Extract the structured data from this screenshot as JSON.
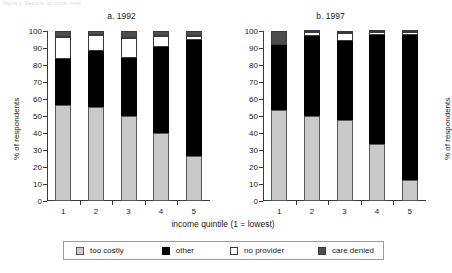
{
  "figure_tag": "Figure 1. Reasons for unmet need",
  "xaxis_title": "income quintile (1 = lowest)",
  "ylabel": "% of respondents",
  "legend": [
    {
      "label": "too costly",
      "key": "too-costly",
      "color": "#c9c9c9"
    },
    {
      "label": "other",
      "key": "other",
      "color": "#000000"
    },
    {
      "label": "no provider",
      "key": "no-provider",
      "color": "#ffffff"
    },
    {
      "label": "care denied",
      "key": "care-denied",
      "color": "#4d4d4d"
    }
  ],
  "panels": [
    {
      "id": "a",
      "title": "a. 1992"
    },
    {
      "id": "b",
      "title": "b. 1997"
    }
  ],
  "yticks": [
    "0",
    "10",
    "20",
    "30",
    "40",
    "50",
    "60",
    "70",
    "80",
    "90",
    "100"
  ],
  "xticks": [
    "1",
    "2",
    "3",
    "4",
    "5"
  ],
  "chart_data": {
    "type": "bar",
    "subtype": "stacked-100-percent",
    "xlabel": "income quintile (1 = lowest)",
    "ylabel": "% of respondents",
    "ylim": [
      0,
      100
    ],
    "ytick_step": 10,
    "grid": false,
    "legend_position": "bottom",
    "legend_entries": [
      "too costly",
      "other",
      "no provider",
      "care denied"
    ],
    "panels": [
      {
        "name": "a. 1992",
        "categories": [
          "1",
          "2",
          "3",
          "4",
          "5"
        ],
        "series": [
          {
            "name": "too costly",
            "values": [
              56.5,
              55.5,
              50.0,
              40.0,
              26.5
            ]
          },
          {
            "name": "other",
            "values": [
              27.0,
              33.0,
              34.0,
              50.5,
              68.5
            ]
          },
          {
            "name": "no provider",
            "values": [
              13.0,
              9.0,
              12.0,
              6.5,
              2.0
            ]
          },
          {
            "name": "care denied",
            "values": [
              3.5,
              2.5,
              4.0,
              3.0,
              3.0
            ]
          }
        ],
        "cumulative_tops": {
          "too costly": [
            56.5,
            55.5,
            50.0,
            40.0,
            26.5
          ],
          "other": [
            83.5,
            88.5,
            84.0,
            90.5,
            95.0
          ],
          "no provider": [
            96.5,
            97.5,
            96.0,
            97.0,
            97.0
          ],
          "care denied": [
            100,
            100,
            100,
            100,
            100
          ]
        }
      },
      {
        "name": "b. 1997",
        "categories": [
          "1",
          "2",
          "3",
          "4",
          "5"
        ],
        "series": [
          {
            "name": "too costly",
            "values": [
              53.5,
              50.0,
              47.5,
              33.5,
              12.5
            ]
          },
          {
            "name": "other",
            "values": [
              38.5,
              47.0,
              46.5,
              64.0,
              85.0
            ]
          },
          {
            "name": "no provider",
            "values": [
              0.0,
              2.5,
              5.0,
              2.0,
              2.0
            ]
          },
          {
            "name": "care denied",
            "values": [
              8.0,
              0.5,
              1.0,
              0.5,
              0.5
            ]
          }
        ],
        "cumulative_tops": {
          "too costly": [
            53.5,
            50.0,
            47.5,
            33.5,
            12.5
          ],
          "other": [
            92.0,
            97.0,
            94.0,
            97.5,
            97.5
          ],
          "no provider": [
            92.0,
            99.5,
            99.0,
            99.5,
            99.5
          ],
          "care denied": [
            100,
            100,
            100,
            100,
            100
          ]
        }
      }
    ]
  }
}
